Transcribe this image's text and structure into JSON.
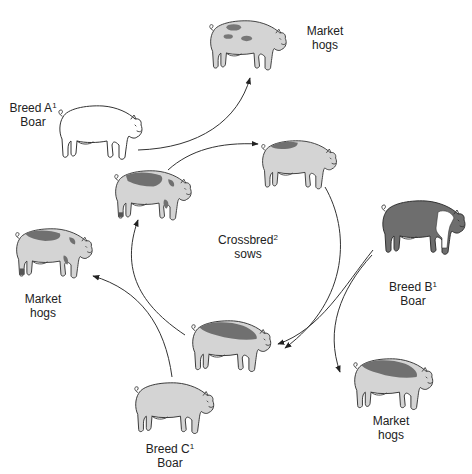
{
  "diagram": {
    "colors": {
      "background": "#ffffff",
      "light_fill": "#d4d4d4",
      "white_fill": "#ffffff",
      "dark_fill": "#6e6e6e",
      "outline": "#333333"
    },
    "nodes": [
      {
        "id": "boar_a",
        "line1": "Breed A",
        "sup": "1",
        "line2": "Boar",
        "pig_style": "white"
      },
      {
        "id": "boar_b",
        "line1": "Breed B",
        "sup": "1",
        "line2": "Boar",
        "pig_style": "dark-with-white-belt"
      },
      {
        "id": "boar_c",
        "line1": "Breed C",
        "sup": "1",
        "line2": "Boar",
        "pig_style": "light"
      },
      {
        "id": "sows",
        "line1": "Crossbred",
        "sup": "2",
        "line2": "sows"
      },
      {
        "id": "market_top",
        "line1": "Market",
        "line2": "hogs",
        "pig_style": "light-spotted"
      },
      {
        "id": "market_left",
        "line1": "Market",
        "line2": "hogs",
        "pig_style": "light-dark-patches"
      },
      {
        "id": "market_bottom_right",
        "line1": "Market",
        "line2": "hogs",
        "pig_style": "light-dark-back"
      }
    ],
    "edges": [
      {
        "from": "boar_a",
        "to": "market_top"
      },
      {
        "from": "sow_top_left",
        "to": "sow_top_right"
      },
      {
        "from": "sow_top_right",
        "to": "sow_bottom",
        "via": "circle-right"
      },
      {
        "from": "boar_b",
        "to": "sow_bottom"
      },
      {
        "from": "boar_b",
        "to": "market_bottom_right"
      },
      {
        "from": "sow_bottom",
        "to": "sow_top_left",
        "via": "circle-left"
      },
      {
        "from": "boar_c",
        "to": "market_left"
      }
    ]
  }
}
